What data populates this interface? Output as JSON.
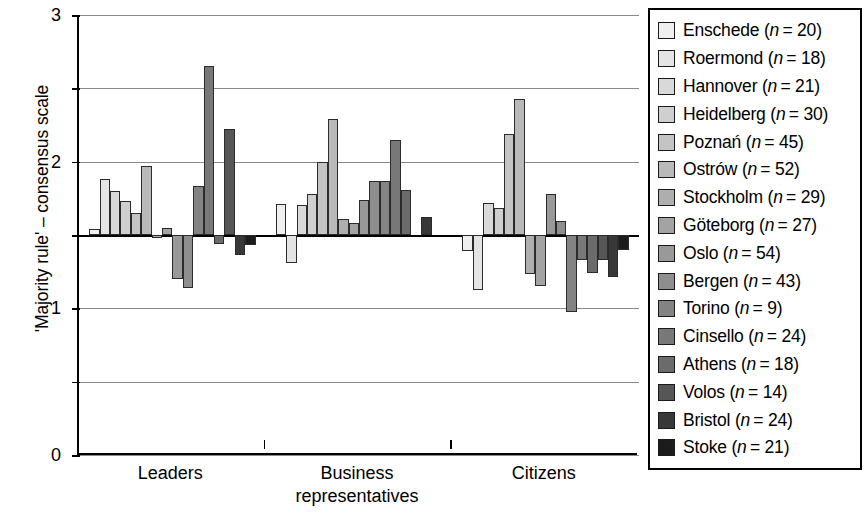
{
  "chart_data": {
    "type": "bar",
    "title": "",
    "xlabel": "",
    "ylabel": "'Majority rule' – consensus scale",
    "ylim": [
      -3,
      3
    ],
    "yticks": [
      3,
      2,
      1,
      0,
      -1,
      -2,
      -3
    ],
    "ytick_labels": [
      "3",
      "2",
      "1",
      "0",
      "−1",
      "−2",
      "−3"
    ],
    "grid": true,
    "legend_position": "right",
    "categories": [
      "Leaders",
      "Business representatives",
      "Citizens"
    ],
    "category_labels": [
      [
        "Leaders"
      ],
      [
        "Business",
        "representatives"
      ],
      [
        "Citizens"
      ]
    ],
    "series": [
      {
        "name": "Enschede",
        "n": 20,
        "label": "Enschede (n = 20)",
        "color": "#efefef",
        "values": [
          0.08,
          0.42,
          -0.22
        ]
      },
      {
        "name": "Roermond",
        "n": 18,
        "label": "Roermond (n = 18)",
        "color": "#e4e4e4",
        "values": [
          0.76,
          -0.38,
          -0.75
        ]
      },
      {
        "name": "Hannover",
        "n": 21,
        "label": "Hannover (n = 21)",
        "color": "#d9d9d9",
        "values": [
          0.6,
          0.41,
          0.44
        ]
      },
      {
        "name": "Heidelberg",
        "n": 30,
        "label": "Heidelberg (n = 30)",
        "color": "#cfcfcf",
        "values": [
          0.46,
          0.56,
          0.37
        ]
      },
      {
        "name": "Poznań",
        "n": 45,
        "label": "Poznań (n = 45)",
        "color": "#c4c4c4",
        "values": [
          0.3,
          1.0,
          1.38
        ]
      },
      {
        "name": "Ostrów",
        "n": 52,
        "label": "Ostrów (n = 52)",
        "color": "#b9b9b9",
        "values": [
          0.94,
          1.58,
          1.85
        ]
      },
      {
        "name": "Stockholm",
        "n": 29,
        "label": "Stockholm (n = 29)",
        "color": "#aeaeae",
        "values": [
          -0.04,
          0.22,
          -0.53
        ]
      },
      {
        "name": "Göteborg",
        "n": 27,
        "label": "Göteborg (n = 27)",
        "color": "#a3a3a3",
        "values": [
          0.1,
          0.17,
          -0.7
        ]
      },
      {
        "name": "Oslo",
        "n": 54,
        "label": "Oslo (n = 54)",
        "color": "#999999",
        "values": [
          -0.6,
          0.48,
          0.56
        ]
      },
      {
        "name": "Bergen",
        "n": 43,
        "label": "Bergen (n = 43)",
        "color": "#8e8e8e",
        "values": [
          -0.72,
          0.74,
          0.19
        ]
      },
      {
        "name": "Torino",
        "n": 9,
        "label": "Torino (n = 9)",
        "color": "#838383",
        "values": [
          0.67,
          0.73,
          -1.05
        ]
      },
      {
        "name": "Cinsello",
        "n": 24,
        "label": "Cinsello (n = 24)",
        "color": "#787878",
        "values": [
          2.31,
          1.3,
          -0.34
        ]
      },
      {
        "name": "Athens",
        "n": 18,
        "label": "Athens (n = 18)",
        "color": "#6b6b6b",
        "values": [
          -0.12,
          0.62,
          -0.52
        ]
      },
      {
        "name": "Volos",
        "n": 14,
        "label": "Volos (n = 14)",
        "color": "#565656",
        "values": [
          1.45,
          0.0,
          -0.34
        ]
      },
      {
        "name": "Bristol",
        "n": 24,
        "label": "Bristol (n = 24)",
        "color": "#383838",
        "values": [
          -0.27,
          0.25,
          -0.57
        ]
      },
      {
        "name": "Stoke",
        "n": 21,
        "label": "Stoke (n = 21)",
        "color": "#1c1c1c",
        "values": [
          -0.13,
          0.0,
          -0.2
        ]
      }
    ]
  },
  "legend": {
    "items": [
      {
        "label_name": "Enschede",
        "n_prefix": "(",
        "n_text": "n",
        "n_eq": "= 20)"
      },
      {
        "label_name": "Roermond",
        "n_prefix": "(",
        "n_text": "n",
        "n_eq": "= 18)"
      },
      {
        "label_name": "Hannover",
        "n_prefix": "(",
        "n_text": "n",
        "n_eq": "= 21)"
      },
      {
        "label_name": "Heidelberg",
        "n_prefix": "(",
        "n_text": "n",
        "n_eq": "= 30)"
      },
      {
        "label_name": "Poznań",
        "n_prefix": "(",
        "n_text": "n",
        "n_eq": "= 45)"
      },
      {
        "label_name": "Ostrów",
        "n_prefix": "(",
        "n_text": "n",
        "n_eq": "= 52)"
      },
      {
        "label_name": "Stockholm",
        "n_prefix": "(",
        "n_text": "n",
        "n_eq": "= 29)"
      },
      {
        "label_name": "Göteborg",
        "n_prefix": "(",
        "n_text": "n",
        "n_eq": "= 27)"
      },
      {
        "label_name": "Oslo",
        "n_prefix": "(",
        "n_text": "n",
        "n_eq": "= 54)"
      },
      {
        "label_name": "Bergen",
        "n_prefix": "(",
        "n_text": "n",
        "n_eq": "= 43)"
      },
      {
        "label_name": "Torino",
        "n_prefix": "(",
        "n_text": "n",
        "n_eq": "= 9)"
      },
      {
        "label_name": "Cinsello",
        "n_prefix": "(",
        "n_text": "n",
        "n_eq": "= 24)"
      },
      {
        "label_name": "Athens",
        "n_prefix": "(",
        "n_text": "n",
        "n_eq": "= 18)"
      },
      {
        "label_name": "Volos",
        "n_prefix": "(",
        "n_text": "n",
        "n_eq": "= 14)"
      },
      {
        "label_name": "Bristol",
        "n_prefix": "(",
        "n_text": "n",
        "n_eq": "= 24)"
      },
      {
        "label_name": "Stoke",
        "n_prefix": "(",
        "n_text": "n",
        "n_eq": "= 21)"
      }
    ]
  },
  "colors": {
    "axis": "#000000",
    "gridline": "#8a8a8a",
    "bar_outline": "#2b2b2b",
    "background": "#ffffff"
  }
}
